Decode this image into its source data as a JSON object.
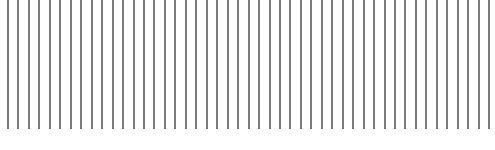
{
  "pattern": {
    "type": "vertical-lines",
    "count": 47,
    "first_x": 8,
    "spacing": 10.46,
    "line_width": 2,
    "line_top": 0,
    "line_bottom": 129,
    "line_color": "#7a7a7a",
    "background": "#ffffff"
  }
}
